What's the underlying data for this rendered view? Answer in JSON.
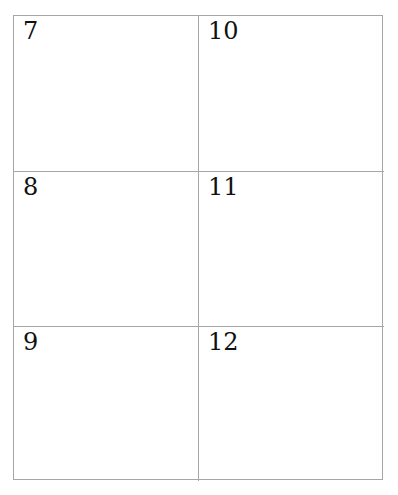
{
  "grid": {
    "cells": [
      {
        "label": "7"
      },
      {
        "label": "8"
      },
      {
        "label": "9"
      },
      {
        "label": "10"
      },
      {
        "label": "11"
      },
      {
        "label": "12"
      }
    ]
  },
  "colors": {
    "border": "#a6a6a6",
    "text": "#111111",
    "background": "#ffffff"
  }
}
